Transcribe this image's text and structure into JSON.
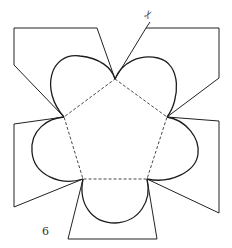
{
  "diagram": {
    "type": "paper-craft net (pentagonal box template)",
    "figure_label": "6",
    "scissors_icon": "✂",
    "colors": {
      "background": "#ffffff",
      "cut_line": "#222222",
      "fold_line": "#333333"
    },
    "pentagon": {
      "vertices": [
        [
          115,
          79
        ],
        [
          167,
          117
        ],
        [
          147,
          179
        ],
        [
          83,
          179
        ],
        [
          64,
          117
        ]
      ],
      "edge_style": "dashed (fold)"
    },
    "lobes": {
      "count": 5,
      "shape": "semicircular flaps on each pentagon edge",
      "edge_style": "solid (cut)"
    },
    "tabs": [
      {
        "name": "top-left",
        "points": [
          [
            115,
            79
          ],
          [
            97,
            28
          ],
          [
            14,
            28
          ],
          [
            14,
            65
          ],
          [
            64,
            117
          ]
        ]
      },
      {
        "name": "top-right",
        "points": [
          [
            115,
            79
          ],
          [
            146,
            28
          ],
          [
            219,
            28
          ],
          [
            219,
            78
          ],
          [
            167,
            117
          ]
        ]
      },
      {
        "name": "left",
        "points": [
          [
            64,
            117
          ],
          [
            14,
            124
          ],
          [
            14,
            207
          ],
          [
            83,
            179
          ]
        ]
      },
      {
        "name": "right",
        "points": [
          [
            167,
            117
          ],
          [
            219,
            121
          ],
          [
            219,
            213
          ],
          [
            147,
            179
          ]
        ]
      },
      {
        "name": "bottom",
        "points": [
          [
            83,
            179
          ],
          [
            68,
            239
          ],
          [
            157,
            239
          ],
          [
            147,
            179
          ]
        ]
      }
    ]
  }
}
